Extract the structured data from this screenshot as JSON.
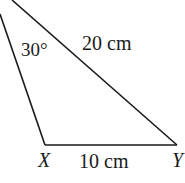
{
  "diagram": {
    "type": "triangle",
    "angle_label": "30°",
    "hypotenuse_label": "20 cm",
    "base_label": "10 cm",
    "vertices": {
      "X": "X",
      "Y": "Y"
    },
    "stroke_color": "#1a1a1a"
  }
}
